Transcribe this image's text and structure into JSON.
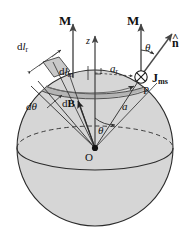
{
  "figure": {
    "colors": {
      "sphere_fill": "#d6d6d6",
      "band_fill": "#b2b2b2",
      "patch_fill": "#c9c9c9",
      "outline": "#2b2b2b",
      "arrow": "#4a4a4a",
      "text": "#111111",
      "background": "#ffffff"
    },
    "labels": {
      "magnetization_left": "M",
      "magnetization_right": "M",
      "z_axis": "z",
      "normal_unit": "n",
      "normal_hat": "^",
      "theta_top": "θ",
      "theta_center": "θ",
      "d_theta": "dθ",
      "dl_r": "dl",
      "dl_r_sub": "r",
      "dl_m": "dl",
      "dl_m_sub": "m",
      "a_r": "a",
      "a_r_sub": "r",
      "radius_a": "a",
      "dB": "dB",
      "current_density": "J",
      "current_density_sub": "ms",
      "point_P": "P",
      "origin_O": "O"
    },
    "icons": {
      "current_into_page": "circle-x-icon",
      "right_angle": "right-angle-mark-icon",
      "origin_dot": "origin-dot-icon"
    }
  }
}
